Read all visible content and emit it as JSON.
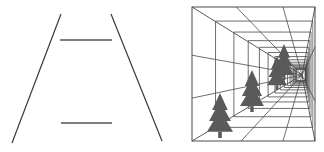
{
  "figure": {
    "left_panel": {
      "name": "ponzo-illusion",
      "converging_lines": [
        {
          "x1": 61,
          "y1": 14,
          "x2": 12,
          "y2": 143
        },
        {
          "x1": 111,
          "y1": 14,
          "x2": 162,
          "y2": 141
        }
      ],
      "horizontal_bars": [
        {
          "x1": 60,
          "x2": 112,
          "y": 40
        },
        {
          "x1": 61,
          "x2": 112,
          "y": 123
        }
      ],
      "stroke_color": "#3a3a3a"
    },
    "right_panel": {
      "name": "perspective-corridor-trees",
      "frame": {
        "x": 192,
        "y": 7,
        "w": 123,
        "h": 134
      },
      "vanishing_point": {
        "x": 302,
        "y": 75
      },
      "stroke_color": "#4a4a4a",
      "tree_color": "#5a5a5a",
      "trees": [
        {
          "cx": 220,
          "base": 138,
          "h": 45,
          "w": 26
        },
        {
          "cx": 252,
          "base": 112,
          "h": 42,
          "w": 24
        },
        {
          "cx": 277,
          "base": 90,
          "h": 34,
          "w": 20
        },
        {
          "cx": 284,
          "base": 80,
          "h": 36,
          "w": 20
        }
      ]
    }
  }
}
